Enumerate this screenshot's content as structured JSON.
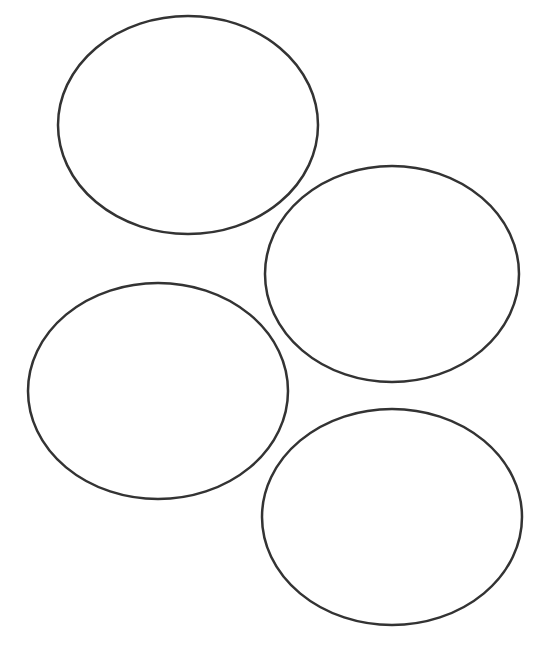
{
  "canvas": {
    "width": 550,
    "height": 654,
    "background": "#ffffff"
  },
  "style": {
    "stroke": "#333333",
    "stroke_width": 2.5,
    "fill": "none"
  },
  "shapes": [
    {
      "id": "ellipse-top",
      "cx": 188,
      "cy": 125,
      "rx": 130,
      "ry": 109
    },
    {
      "id": "ellipse-right",
      "cx": 392,
      "cy": 274,
      "rx": 127,
      "ry": 108
    },
    {
      "id": "ellipse-left",
      "cx": 158,
      "cy": 391,
      "rx": 130,
      "ry": 108
    },
    {
      "id": "ellipse-bottom-right",
      "cx": 392,
      "cy": 517,
      "rx": 130,
      "ry": 108
    }
  ]
}
